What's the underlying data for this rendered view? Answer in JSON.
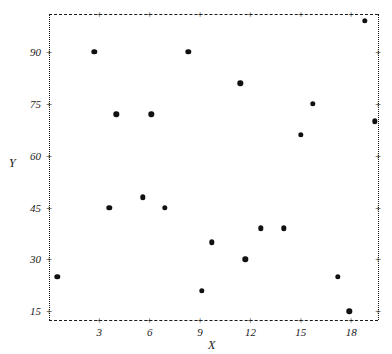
{
  "chart_data": {
    "type": "scatter",
    "title": "",
    "xlabel": "X",
    "ylabel": "Y",
    "xlim": [
      0,
      19.6
    ],
    "ylim": [
      12.5,
      101
    ],
    "xticks": [
      3,
      6,
      9,
      12,
      15,
      18
    ],
    "yticks": [
      15,
      30,
      45,
      60,
      75,
      90
    ],
    "grid": false,
    "legend": null,
    "marker": "filled-circle",
    "marker_color": "#111111",
    "frame": {
      "top": "dashed",
      "bottom": "dashed",
      "left": "dotted",
      "right": "dotted"
    },
    "points": [
      {
        "x": 0.5,
        "y": 25
      },
      {
        "x": 2.7,
        "y": 90
      },
      {
        "x": 3.6,
        "y": 45
      },
      {
        "x": 4.0,
        "y": 72
      },
      {
        "x": 5.6,
        "y": 48
      },
      {
        "x": 6.1,
        "y": 72
      },
      {
        "x": 6.9,
        "y": 45
      },
      {
        "x": 8.3,
        "y": 90
      },
      {
        "x": 9.1,
        "y": 21
      },
      {
        "x": 9.7,
        "y": 35
      },
      {
        "x": 11.4,
        "y": 81
      },
      {
        "x": 11.7,
        "y": 30
      },
      {
        "x": 12.6,
        "y": 39
      },
      {
        "x": 14.0,
        "y": 39
      },
      {
        "x": 15.0,
        "y": 66
      },
      {
        "x": 15.7,
        "y": 75
      },
      {
        "x": 17.2,
        "y": 25
      },
      {
        "x": 17.9,
        "y": 15
      },
      {
        "x": 18.8,
        "y": 99
      },
      {
        "x": 19.4,
        "y": 70
      }
    ]
  },
  "axes": {
    "y_title": "Y",
    "x_title": "X",
    "y_tick_labels": [
      "90",
      "75",
      "60",
      "45",
      "30",
      "15"
    ],
    "x_tick_labels": [
      "3",
      "6",
      "9",
      "12",
      "15",
      "18"
    ],
    "tick_glyph": "+"
  }
}
